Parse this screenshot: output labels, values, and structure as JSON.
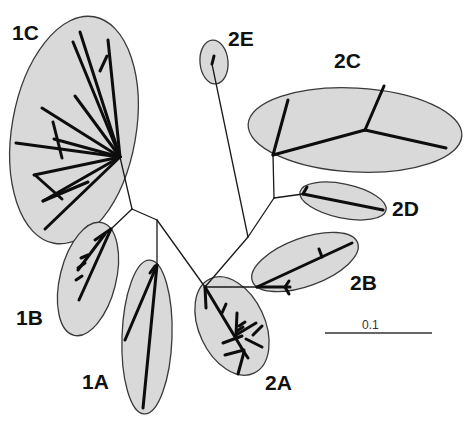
{
  "figure": {
    "type": "unrooted phylogenetic tree",
    "scale_bar": {
      "label": "0.1",
      "x1": 325,
      "x2": 432,
      "y": 333,
      "label_x": 362,
      "label_y": 319
    }
  },
  "clades": [
    {
      "id": "1C",
      "label": "1C",
      "label_x": 12,
      "label_y": 22,
      "ellipse": {
        "cx": 74,
        "cy": 130,
        "rx": 62,
        "ry": 115,
        "rot": 10
      }
    },
    {
      "id": "1B",
      "label": "1B",
      "label_x": 16,
      "label_y": 307,
      "ellipse": {
        "cx": 88,
        "cy": 279,
        "rx": 28,
        "ry": 58,
        "rot": 14
      }
    },
    {
      "id": "1A",
      "label": "1A",
      "label_x": 82,
      "label_y": 371,
      "ellipse": {
        "cx": 147,
        "cy": 337,
        "rx": 25,
        "ry": 77,
        "rot": 2
      }
    },
    {
      "id": "2A",
      "label": "2A",
      "label_x": 265,
      "label_y": 372,
      "ellipse": {
        "cx": 232,
        "cy": 326,
        "rx": 33,
        "ry": 52,
        "rot": -25
      }
    },
    {
      "id": "2B",
      "label": "2B",
      "label_x": 350,
      "label_y": 272,
      "ellipse": {
        "cx": 305,
        "cy": 262,
        "rx": 56,
        "ry": 24,
        "rot": -20
      }
    },
    {
      "id": "2C",
      "label": "2C",
      "label_x": 334,
      "label_y": 50,
      "ellipse": {
        "cx": 355,
        "cy": 130,
        "rx": 107,
        "ry": 42,
        "rot": 3
      }
    },
    {
      "id": "2D",
      "label": "2D",
      "label_x": 392,
      "label_y": 198,
      "ellipse": {
        "cx": 343,
        "cy": 201,
        "rx": 44,
        "ry": 17,
        "rot": 12
      }
    },
    {
      "id": "2E",
      "label": "2E",
      "label_x": 228,
      "label_y": 28,
      "ellipse": {
        "cx": 214,
        "cy": 62,
        "rx": 14,
        "ry": 22,
        "rot": -5
      }
    }
  ],
  "branches": {
    "thin": [
      [
        120,
        157,
        132,
        209
      ],
      [
        132,
        209,
        157,
        220
      ],
      [
        132,
        209,
        111,
        229
      ],
      [
        157,
        220,
        157,
        265
      ],
      [
        157,
        220,
        205,
        287
      ],
      [
        205,
        287,
        248,
        237
      ],
      [
        248,
        237,
        274,
        198
      ],
      [
        274,
        198,
        273,
        155
      ],
      [
        274,
        198,
        303,
        194
      ],
      [
        248,
        237,
        212,
        64
      ],
      [
        205,
        287,
        257,
        287
      ]
    ],
    "thick": [
      [
        120,
        157,
        80,
        32
      ],
      [
        120,
        157,
        108,
        40
      ],
      [
        120,
        157,
        73,
        42
      ],
      [
        120,
        157,
        75,
        96
      ],
      [
        120,
        157,
        42,
        108
      ],
      [
        120,
        157,
        54,
        139
      ],
      [
        120,
        157,
        16,
        143
      ],
      [
        120,
        157,
        34,
        175
      ],
      [
        120,
        157,
        43,
        201
      ],
      [
        120,
        157,
        45,
        229
      ],
      [
        100,
        71,
        107,
        56
      ],
      [
        62,
        158,
        53,
        122
      ],
      [
        62,
        199,
        35,
        175
      ],
      [
        88,
        182,
        43,
        201
      ],
      [
        111,
        229,
        79,
        300
      ],
      [
        111,
        229,
        95,
        240
      ],
      [
        105,
        234,
        78,
        270
      ],
      [
        81,
        258,
        88,
        255
      ],
      [
        78,
        268,
        85,
        263
      ],
      [
        76,
        280,
        82,
        276
      ],
      [
        157,
        265,
        143,
        408
      ],
      [
        157,
        265,
        125,
        340
      ],
      [
        150,
        273,
        155,
        266
      ],
      [
        205,
        287,
        206,
        308
      ],
      [
        205,
        287,
        244,
        352
      ],
      [
        222,
        313,
        226,
        304
      ],
      [
        236,
        335,
        237,
        313
      ],
      [
        236,
        335,
        256,
        323
      ],
      [
        246,
        339,
        262,
        347
      ],
      [
        242,
        336,
        223,
        343
      ],
      [
        244,
        350,
        225,
        355
      ],
      [
        244,
        352,
        238,
        374
      ],
      [
        244,
        352,
        248,
        358
      ],
      [
        239,
        326,
        245,
        322
      ],
      [
        237,
        331,
        243,
        327
      ],
      [
        253,
        335,
        262,
        326
      ],
      [
        257,
        287,
        352,
        243
      ],
      [
        257,
        287,
        290,
        287
      ],
      [
        322,
        257,
        319,
        249
      ],
      [
        285,
        287,
        289,
        281
      ],
      [
        285,
        287,
        289,
        294
      ],
      [
        303,
        194,
        383,
        210
      ],
      [
        303,
        194,
        307,
        187
      ],
      [
        273,
        155,
        288,
        100
      ],
      [
        273,
        155,
        365,
        130
      ],
      [
        365,
        130,
        384,
        86
      ],
      [
        365,
        130,
        446,
        148
      ],
      [
        212,
        64,
        214,
        56
      ]
    ]
  }
}
